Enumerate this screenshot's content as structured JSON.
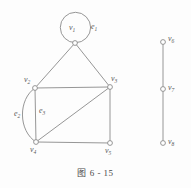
{
  "figure": {
    "caption": "图 6 - 15",
    "stroke_color": "#8a8a8a",
    "node_fill": "#ffffff",
    "label_color": "#5a5a5a",
    "background": "#fdfdfd",
    "width": 191,
    "height": 188
  },
  "graph": {
    "vertices": [
      {
        "id": "v1",
        "label": "v",
        "sub": "1",
        "x": 75,
        "y": 43,
        "label_x": 69,
        "label_y": 24
      },
      {
        "id": "v2",
        "label": "v",
        "sub": "2",
        "x": 35,
        "y": 88,
        "label_x": 25,
        "label_y": 77
      },
      {
        "id": "v3",
        "label": "v",
        "sub": "3",
        "x": 110,
        "y": 87,
        "label_x": 111,
        "label_y": 76
      },
      {
        "id": "v4",
        "label": "v",
        "sub": "4",
        "x": 36,
        "y": 142,
        "label_x": 30,
        "label_y": 146
      },
      {
        "id": "v5",
        "label": "v",
        "sub": "5",
        "x": 110,
        "y": 143,
        "label_x": 105,
        "label_y": 147
      },
      {
        "id": "v6",
        "label": "v",
        "sub": "6",
        "x": 163,
        "y": 42,
        "label_x": 168,
        "label_y": 36
      },
      {
        "id": "v7",
        "label": "v",
        "sub": "7",
        "x": 163,
        "y": 89,
        "label_x": 168,
        "label_y": 85
      },
      {
        "id": "v8",
        "label": "v",
        "sub": "8",
        "x": 163,
        "y": 143,
        "label_x": 168,
        "label_y": 139
      }
    ],
    "edges": [
      {
        "id": "e1",
        "type": "loop",
        "from": "v1",
        "to": "v1",
        "label": "e",
        "sub": "1",
        "label_x": 91,
        "label_y": 24
      },
      {
        "id": "v1v2",
        "type": "line",
        "from": "v1",
        "to": "v2"
      },
      {
        "id": "v1v3",
        "type": "line",
        "from": "v1",
        "to": "v3"
      },
      {
        "id": "v2v3",
        "type": "line",
        "from": "v2",
        "to": "v3"
      },
      {
        "id": "e2",
        "type": "curve",
        "from": "v2",
        "to": "v4",
        "label": "e",
        "sub": "2",
        "label_x": 15,
        "label_y": 112
      },
      {
        "id": "e3",
        "type": "line",
        "from": "v2",
        "to": "v4",
        "label": "e",
        "sub": "3",
        "label_x": 39,
        "label_y": 109
      },
      {
        "id": "v3v5",
        "type": "line",
        "from": "v3",
        "to": "v5"
      },
      {
        "id": "v3v4",
        "type": "line",
        "from": "v3",
        "to": "v4"
      },
      {
        "id": "v4v5",
        "type": "line",
        "from": "v4",
        "to": "v5"
      },
      {
        "id": "v6v7",
        "type": "line",
        "from": "v6",
        "to": "v7"
      },
      {
        "id": "v7v8",
        "type": "line",
        "from": "v7",
        "to": "v8"
      }
    ]
  }
}
